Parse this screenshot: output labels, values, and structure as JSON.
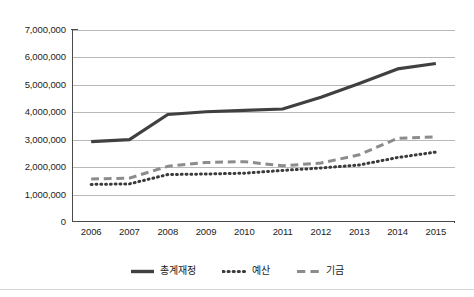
{
  "chart_data": {
    "type": "line",
    "title": "",
    "subtitle": "",
    "xlabel": "",
    "ylabel": "",
    "categories": [
      "2006",
      "2007",
      "2008",
      "2009",
      "2010",
      "2011",
      "2012",
      "2013",
      "2014",
      "2015"
    ],
    "x": [
      2006,
      2007,
      2008,
      2009,
      2010,
      2011,
      2012,
      2013,
      2014,
      2015
    ],
    "ylim": [
      0,
      7000000
    ],
    "ytick_step": 1000000,
    "ytick_labels": [
      "0",
      "1,000,000",
      "2,000,000",
      "3,000,000",
      "4,000,000",
      "5,000,000",
      "6,000,000",
      "7,000,000"
    ],
    "ytick_values": [
      0,
      1000000,
      2000000,
      3000000,
      4000000,
      5000000,
      6000000,
      7000000
    ],
    "grid": "horizontal",
    "legend_position": "bottom",
    "series": [
      {
        "name": "총계재정",
        "style": "solid",
        "color": "#404040",
        "width": 3.2,
        "values": [
          2930000,
          3000000,
          3920000,
          4020000,
          4070000,
          4120000,
          4550000,
          5050000,
          5580000,
          5780000
        ]
      },
      {
        "name": "예산",
        "style": "dotted",
        "color": "#3a3a3a",
        "width": 3.0,
        "values": [
          1370000,
          1390000,
          1730000,
          1750000,
          1780000,
          1880000,
          1970000,
          2080000,
          2350000,
          2550000
        ]
      },
      {
        "name": "기금",
        "style": "dashed",
        "color": "#8c8c8c",
        "width": 3.0,
        "values": [
          1570000,
          1600000,
          2030000,
          2170000,
          2200000,
          2050000,
          2150000,
          2450000,
          3050000,
          3100000
        ]
      }
    ]
  },
  "axes": {
    "y_labels": [
      "7,000,000",
      "6,000,000",
      "5,000,000",
      "4,000,000",
      "3,000,000",
      "2,000,000",
      "1,000,000",
      "0"
    ],
    "x_labels": [
      "2006",
      "2007",
      "2008",
      "2009",
      "2010",
      "2011",
      "2012",
      "2013",
      "2014",
      "2015"
    ]
  },
  "legend": {
    "items": [
      {
        "label": "총계재정",
        "style": "solid",
        "color": "#404040"
      },
      {
        "label": "예산",
        "style": "dotted",
        "color": "#3a3a3a"
      },
      {
        "label": "기금",
        "style": "dashed",
        "color": "#8c8c8c"
      }
    ]
  }
}
